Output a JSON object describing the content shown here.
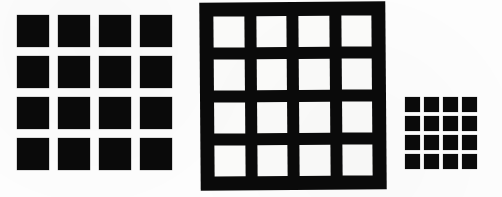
{
  "canvas": {
    "width": 502,
    "height": 197,
    "background_color": "#fdfdfd",
    "ink_color": "#0a0a0a",
    "paper_color": "#fbfbfa",
    "description": "Three scanned black-and-white grid figures arranged left to right illustrating figure-ground reversal and scale change."
  },
  "figures": [
    {
      "id": "figure-a",
      "name": "large-black-square-grid",
      "polarity": "black squares on white ground",
      "rows": 4,
      "columns": 4,
      "cell_count": 16,
      "cell_size_px": 32,
      "gap_px": 9,
      "bounds": {
        "x": 17,
        "y": 15,
        "width": 156,
        "height": 156
      },
      "cells": [
        "black",
        "black",
        "black",
        "black",
        "black",
        "black",
        "black",
        "black",
        "black",
        "black",
        "black",
        "black",
        "black",
        "black",
        "black",
        "black"
      ]
    },
    {
      "id": "figure-b",
      "name": "black-slab-with-white-square-holes",
      "polarity": "white squares on black ground",
      "rows": 4,
      "columns": 4,
      "cell_count": 16,
      "cell_size_px": 32,
      "bar_thickness_px": 12,
      "border_thickness_px": 14,
      "rotation_deg": -0.45,
      "bounds": {
        "x": 200,
        "y": 2,
        "width": 186,
        "height": 188
      },
      "cells": [
        "white",
        "white",
        "white",
        "white",
        "white",
        "white",
        "white",
        "white",
        "white",
        "white",
        "white",
        "white",
        "white",
        "white",
        "white",
        "white"
      ]
    },
    {
      "id": "figure-c",
      "name": "small-black-square-grid",
      "polarity": "black squares on white ground",
      "rows": 4,
      "columns": 4,
      "cell_count": 16,
      "cell_size_px": 15,
      "gap_px": 4,
      "bounds": {
        "x": 405,
        "y": 97,
        "width": 73,
        "height": 75
      },
      "cells": [
        "black",
        "black",
        "black",
        "black",
        "black",
        "black",
        "black",
        "black",
        "black",
        "black",
        "black",
        "black",
        "black",
        "black",
        "black",
        "black"
      ]
    }
  ]
}
